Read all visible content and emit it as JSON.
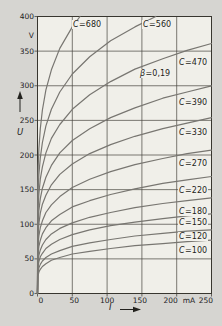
{
  "figure": {
    "y_axis": {
      "label": "U",
      "unit": "V",
      "tick_labels": [
        "400",
        "350",
        "300",
        "250",
        "200",
        "150",
        "100",
        "50",
        "0"
      ]
    },
    "x_axis": {
      "label": "I",
      "unit": "mA",
      "tick_labels": [
        "0",
        "50",
        "100",
        "150",
        "200",
        "250"
      ]
    }
  },
  "chart_data": {
    "type": "line",
    "title": "",
    "xlabel": "I",
    "x_unit": "mA",
    "ylabel": "U",
    "y_unit": "V",
    "xlim": [
      0,
      250
    ],
    "ylim": [
      0,
      400
    ],
    "x_ticks": [
      0,
      50,
      100,
      150,
      200,
      250
    ],
    "y_ticks": [
      0,
      50,
      100,
      150,
      200,
      250,
      300,
      350,
      400
    ],
    "grid": true,
    "legend_position": "labels-on-curves",
    "annotations": [
      {
        "text": "β=0,19",
        "label_px": {
          "x": 139,
          "y": 74
        }
      }
    ],
    "curves": [
      {
        "label": "C=680",
        "C": 680,
        "label_px": {
          "x": 72,
          "y": 25
        },
        "points": [
          [
            0,
            0
          ],
          [
            0.5,
            160
          ],
          [
            1,
            183
          ],
          [
            2,
            209
          ],
          [
            4,
            238
          ],
          [
            7,
            265
          ],
          [
            12,
            294
          ],
          [
            20,
            323
          ],
          [
            32,
            354
          ],
          [
            50,
            385
          ],
          [
            61,
            400
          ]
        ]
      },
      {
        "label": "C=560",
        "C": 560,
        "label_px": {
          "x": 142,
          "y": 25
        },
        "points": [
          [
            0,
            0
          ],
          [
            0.5,
            132
          ],
          [
            1,
            151
          ],
          [
            2,
            172
          ],
          [
            4,
            196
          ],
          [
            7,
            218
          ],
          [
            12,
            242
          ],
          [
            20,
            266
          ],
          [
            32,
            291
          ],
          [
            50,
            317
          ],
          [
            75,
            342
          ],
          [
            105,
            365
          ],
          [
            140,
            385
          ],
          [
            170,
            400
          ]
        ]
      },
      {
        "label": "C=470",
        "C": 470,
        "label_px": {
          "x": 178,
          "y": 63
        },
        "points": [
          [
            0,
            0
          ],
          [
            0.5,
            111
          ],
          [
            1,
            126
          ],
          [
            2,
            144
          ],
          [
            4,
            165
          ],
          [
            7,
            183
          ],
          [
            12,
            203
          ],
          [
            20,
            224
          ],
          [
            32,
            244
          ],
          [
            50,
            266
          ],
          [
            75,
            287
          ],
          [
            105,
            306
          ],
          [
            140,
            324
          ],
          [
            180,
            339
          ],
          [
            215,
            351
          ],
          [
            250,
            361
          ]
        ]
      },
      {
        "label": "C=390",
        "C": 390,
        "label_px": {
          "x": 178,
          "y": 103
        },
        "points": [
          [
            0,
            0
          ],
          [
            0.5,
            92
          ],
          [
            1,
            105
          ],
          [
            2,
            120
          ],
          [
            4,
            137
          ],
          [
            7,
            152
          ],
          [
            12,
            168
          ],
          [
            20,
            185
          ],
          [
            32,
            203
          ],
          [
            50,
            221
          ],
          [
            75,
            238
          ],
          [
            105,
            254
          ],
          [
            140,
            268
          ],
          [
            180,
            282
          ],
          [
            215,
            291
          ],
          [
            250,
            300
          ]
        ]
      },
      {
        "label": "C=330",
        "C": 330,
        "label_px": {
          "x": 178,
          "y": 133
        },
        "points": [
          [
            0,
            0
          ],
          [
            0.5,
            78
          ],
          [
            1,
            89
          ],
          [
            2,
            101
          ],
          [
            4,
            116
          ],
          [
            7,
            129
          ],
          [
            12,
            142
          ],
          [
            20,
            157
          ],
          [
            32,
            172
          ],
          [
            50,
            187
          ],
          [
            75,
            202
          ],
          [
            105,
            215
          ],
          [
            140,
            227
          ],
          [
            180,
            238
          ],
          [
            215,
            246
          ],
          [
            250,
            254
          ]
        ]
      },
      {
        "label": "C=270",
        "C": 270,
        "label_px": {
          "x": 178,
          "y": 164
        },
        "points": [
          [
            0,
            0
          ],
          [
            0.5,
            64
          ],
          [
            1,
            73
          ],
          [
            2,
            83
          ],
          [
            4,
            95
          ],
          [
            7,
            105
          ],
          [
            12,
            117
          ],
          [
            20,
            128
          ],
          [
            32,
            140
          ],
          [
            50,
            153
          ],
          [
            75,
            165
          ],
          [
            105,
            176
          ],
          [
            140,
            186
          ],
          [
            180,
            195
          ],
          [
            215,
            202
          ],
          [
            250,
            207
          ]
        ]
      },
      {
        "label": "C=220",
        "C": 220,
        "label_px": {
          "x": 178,
          "y": 191
        },
        "points": [
          [
            0,
            0
          ],
          [
            0.5,
            52
          ],
          [
            1,
            59
          ],
          [
            2,
            68
          ],
          [
            4,
            77
          ],
          [
            7,
            86
          ],
          [
            12,
            95
          ],
          [
            20,
            105
          ],
          [
            32,
            114
          ],
          [
            50,
            125
          ],
          [
            75,
            134
          ],
          [
            105,
            143
          ],
          [
            140,
            151
          ],
          [
            180,
            159
          ],
          [
            215,
            164
          ],
          [
            250,
            169
          ]
        ]
      },
      {
        "label": "C=180",
        "C": 180,
        "label_px": {
          "x": 178,
          "y": 212
        },
        "points": [
          [
            0,
            0
          ],
          [
            0.5,
            42
          ],
          [
            1,
            48
          ],
          [
            2,
            55
          ],
          [
            4,
            63
          ],
          [
            7,
            70
          ],
          [
            12,
            78
          ],
          [
            20,
            86
          ],
          [
            32,
            94
          ],
          [
            50,
            102
          ],
          [
            75,
            110
          ],
          [
            105,
            117
          ],
          [
            140,
            124
          ],
          [
            180,
            130
          ],
          [
            215,
            134
          ],
          [
            250,
            138
          ]
        ]
      },
      {
        "label": "C=150",
        "C": 150,
        "label_px": {
          "x": 178,
          "y": 223
        },
        "points": [
          [
            0,
            0
          ],
          [
            0.5,
            35
          ],
          [
            1,
            40
          ],
          [
            2,
            46
          ],
          [
            4,
            53
          ],
          [
            7,
            58
          ],
          [
            12,
            65
          ],
          [
            20,
            71
          ],
          [
            32,
            78
          ],
          [
            50,
            85
          ],
          [
            75,
            92
          ],
          [
            105,
            98
          ],
          [
            140,
            103
          ],
          [
            180,
            108
          ],
          [
            215,
            112
          ],
          [
            250,
            115
          ]
        ]
      },
      {
        "label": "C=120",
        "C": 120,
        "label_px": {
          "x": 178,
          "y": 237
        },
        "points": [
          [
            0,
            0
          ],
          [
            0.5,
            28
          ],
          [
            1,
            32
          ],
          [
            2,
            37
          ],
          [
            4,
            42
          ],
          [
            7,
            47
          ],
          [
            12,
            52
          ],
          [
            20,
            57
          ],
          [
            32,
            62
          ],
          [
            50,
            68
          ],
          [
            75,
            73
          ],
          [
            105,
            78
          ],
          [
            140,
            83
          ],
          [
            180,
            87
          ],
          [
            215,
            90
          ],
          [
            250,
            92
          ]
        ]
      },
      {
        "label": "C=100",
        "C": 100,
        "label_px": {
          "x": 178,
          "y": 251
        },
        "points": [
          [
            0,
            0
          ],
          [
            0.5,
            24
          ],
          [
            1,
            27
          ],
          [
            2,
            31
          ],
          [
            4,
            35
          ],
          [
            7,
            39
          ],
          [
            12,
            43
          ],
          [
            20,
            48
          ],
          [
            32,
            52
          ],
          [
            50,
            57
          ],
          [
            75,
            61
          ],
          [
            105,
            65
          ],
          [
            140,
            69
          ],
          [
            180,
            72
          ],
          [
            215,
            75
          ],
          [
            250,
            77
          ]
        ]
      }
    ]
  }
}
